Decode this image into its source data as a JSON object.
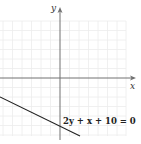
{
  "diagram": {
    "type": "cartesian-graph",
    "axes": {
      "x_label": "x",
      "y_label": "y"
    },
    "line": {
      "equation_label": "2y + x + 10 = 0",
      "color": "#222222"
    },
    "colors": {
      "grid": "#eeeeee",
      "axis": "#666666",
      "background": "#ffffff"
    }
  }
}
